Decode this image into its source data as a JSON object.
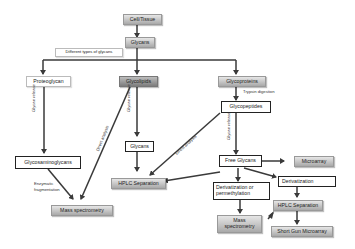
{
  "diagram": {
    "nodes": {
      "cell_tissue": "Cell/Tissue",
      "glycans_top": "Glycans",
      "types_note": "Different types of glycans",
      "proteoglycan": "Proteoglycan",
      "glycolipids": "Glycolipids",
      "glycoproteins": "Glycoproteins",
      "glycopeptides": "Glycopeptides",
      "glycans_mid": "Glycans",
      "glycosaminoglycans": "Glycosaminoglycans",
      "hplc_left": "HPLC Separation",
      "mass_spec_left": "Mass spectrometry",
      "free_glycans": "Free Glycans",
      "microarray": "Microarray",
      "derivatization_perm": "Derivatization or permethylation",
      "derivatization": "Derivatization",
      "hplc_right": "HPLC Separation",
      "mass_spec_right": "Mass spectrometry",
      "shotgun_microarray": "Short Gun Microarray"
    },
    "edge_labels": {
      "glycan_release_1": "Glycan release",
      "glycan_release_2": "Glycan release",
      "glycan_release_3": "Glycan release",
      "direct_analysis_1": "Direct analysis",
      "direct_analysis_2": "Direct analysis",
      "trypsin": "Trypsin digestion",
      "enzymatic_1": "Enzymatic",
      "enzymatic_2": "fragmentation"
    },
    "colors": {
      "line": "#3a3a3a",
      "box_grey": "#b5b5b5",
      "box_dark": "#8a8a8a"
    }
  }
}
